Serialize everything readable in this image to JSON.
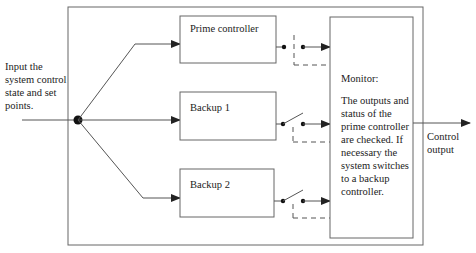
{
  "input_label": [
    "Input the",
    "system control",
    "state and set",
    "points."
  ],
  "controllers": [
    {
      "label": "Prime controller",
      "switch_state": "closed"
    },
    {
      "label": "Backup 1",
      "switch_state": "open"
    },
    {
      "label": "Backup 2",
      "switch_state": "open"
    }
  ],
  "monitor": {
    "title": "Monitor:",
    "description": [
      "The outputs and",
      "status of the",
      "prime controller",
      "are checked. If",
      "necessary the",
      "system switches",
      "to a backup",
      "controller."
    ]
  },
  "output_label": [
    "Control",
    "output"
  ],
  "colors": {
    "line": "#555555",
    "box_border": "#666666",
    "text": "#222222"
  }
}
